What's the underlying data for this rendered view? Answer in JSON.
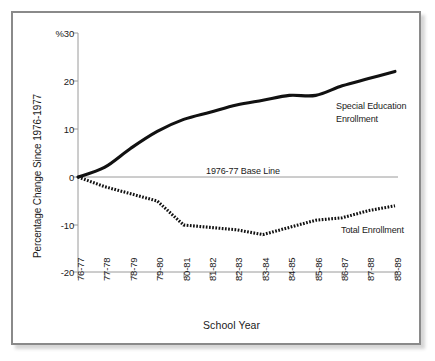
{
  "chart_data": {
    "type": "line",
    "title": "",
    "xlabel": "School Year",
    "ylabel": "Percentage Change Since 1976-1977",
    "ylim": [
      -20,
      30
    ],
    "grid": false,
    "legend_position": "inline-annotation",
    "y_axis_unit_marker": "%",
    "yticks": [
      30,
      20,
      10,
      0,
      -10,
      -20
    ],
    "ytick_labels": [
      "%30",
      "20",
      "10",
      "0",
      "-10",
      "-20"
    ],
    "categories": [
      "76-77",
      "77-78",
      "78-79",
      "79-80",
      "80-81",
      "81-82",
      "82-83",
      "83-84",
      "84-85",
      "85-86",
      "86-87",
      "87-88",
      "88-89"
    ],
    "series": [
      {
        "name": "Special Education Enrollment",
        "style": "solid",
        "color": "#111111",
        "values": [
          0,
          2,
          6,
          9.5,
          12,
          13.5,
          15,
          16,
          17,
          17,
          19,
          20.5,
          22
        ]
      },
      {
        "name": "Total Enrollment",
        "style": "dotted",
        "color": "#111111",
        "values": [
          0,
          -2,
          -3.5,
          -5,
          -10,
          -10.5,
          -11,
          -12,
          -10.5,
          -9,
          -8.5,
          -7,
          -6
        ]
      }
    ],
    "annotations": [
      {
        "id": "special-education-label",
        "text_line_1": "Special Education",
        "text_line_2": "Enrollment"
      },
      {
        "id": "total-enrollment-label",
        "text": "Total Enrollment"
      },
      {
        "id": "baseline-label",
        "text": "1976-77 Base Line",
        "value": 0
      }
    ]
  }
}
